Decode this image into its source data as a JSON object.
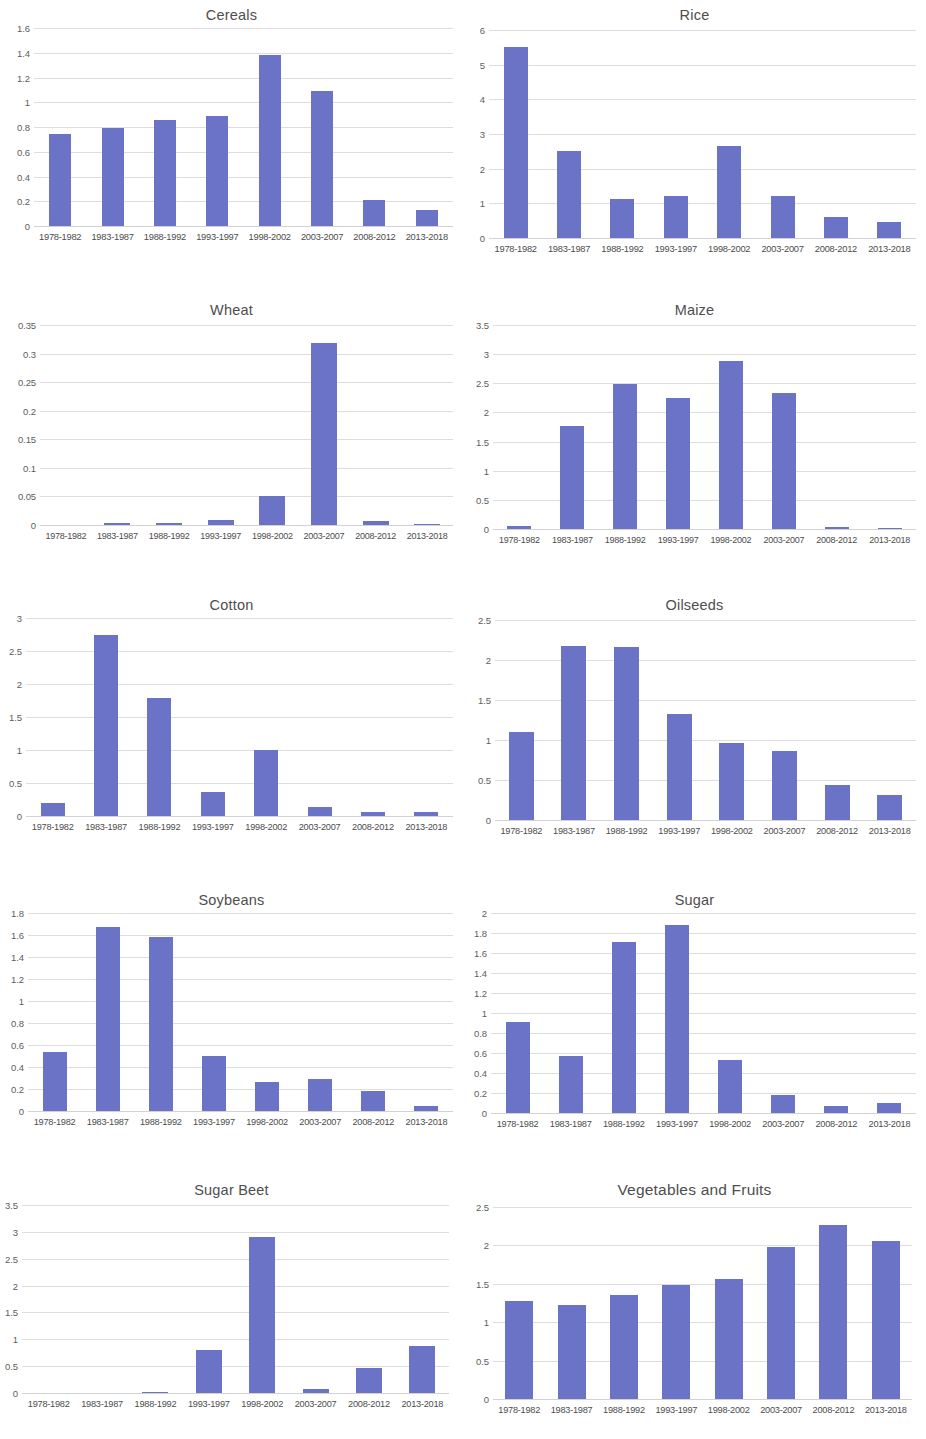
{
  "figure": {
    "panel_count": 8,
    "bar_color": "#6b73c6",
    "gridline_color": "#d8d8dc",
    "categories": [
      "1978-1982",
      "1983-1987",
      "1988-1992",
      "1993-1997",
      "1998-2002",
      "2003-2007",
      "2008-2012",
      "2013-2018"
    ]
  },
  "chart_data": [
    {
      "type": "bar",
      "title": "Cereals",
      "xlabel": "",
      "ylabel": "",
      "categories": [
        "1978-1982",
        "1983-1987",
        "1988-1992",
        "1993-1997",
        "1998-2002",
        "2003-2007",
        "2008-2012",
        "2013-2018"
      ],
      "values": [
        0.74,
        0.79,
        0.86,
        0.89,
        1.38,
        1.09,
        0.21,
        0.13
      ],
      "ylim": [
        0,
        1.6
      ],
      "yticks": [
        0,
        0.2,
        0.4,
        0.6,
        0.8,
        1,
        1.2,
        1.4,
        1.6
      ],
      "ytick_labels": [
        "0",
        "0.2",
        "0.4",
        "0.6",
        "0.8",
        "1",
        "1.2",
        "1.4",
        "1.6"
      ],
      "grid": true,
      "legend": "none"
    },
    {
      "type": "bar",
      "title": "Rice",
      "xlabel": "",
      "ylabel": "",
      "categories": [
        "1978-1982",
        "1983-1987",
        "1988-1992",
        "1993-1997",
        "1998-2002",
        "2003-2007",
        "2008-2012",
        "2013-2018"
      ],
      "values": [
        5.5,
        2.5,
        1.12,
        1.2,
        2.65,
        1.22,
        0.62,
        0.45
      ],
      "ylim": [
        0,
        6
      ],
      "yticks": [
        0,
        1,
        2,
        3,
        4,
        5,
        6
      ],
      "ytick_labels": [
        "0",
        "1",
        "2",
        "3",
        "4",
        "5",
        "6"
      ],
      "grid": true,
      "legend": "none"
    },
    {
      "type": "bar",
      "title": "Wheat",
      "xlabel": "",
      "ylabel": "",
      "categories": [
        "1978-1982",
        "1983-1987",
        "1988-1992",
        "1993-1997",
        "1998-2002",
        "2003-2007",
        "2008-2012",
        "2013-2018"
      ],
      "values": [
        0,
        0.003,
        0.003,
        0.009,
        0.051,
        0.318,
        0.007,
        0.002
      ],
      "ylim": [
        0,
        0.35
      ],
      "yticks": [
        0,
        0.05,
        0.1,
        0.15,
        0.2,
        0.25,
        0.3,
        0.35
      ],
      "ytick_labels": [
        "0",
        "0.05",
        "0.1",
        "0.15",
        "0.2",
        "0.25",
        "0.3",
        "0.35"
      ],
      "grid": true,
      "legend": "none"
    },
    {
      "type": "bar",
      "title": "Maize",
      "xlabel": "",
      "ylabel": "",
      "categories": [
        "1978-1982",
        "1983-1987",
        "1988-1992",
        "1993-1997",
        "1998-2002",
        "2003-2007",
        "2008-2012",
        "2013-2018"
      ],
      "values": [
        0.06,
        1.76,
        2.48,
        2.25,
        2.89,
        2.34,
        0.04,
        0.005
      ],
      "ylim": [
        0,
        3.5
      ],
      "yticks": [
        0,
        0.5,
        1,
        1.5,
        2,
        2.5,
        3,
        3.5
      ],
      "ytick_labels": [
        "0",
        "0.5",
        "1",
        "1.5",
        "2",
        "2.5",
        "3",
        "3.5"
      ],
      "grid": true,
      "legend": "none"
    },
    {
      "type": "bar",
      "title": "Cotton",
      "xlabel": "",
      "ylabel": "",
      "categories": [
        "1978-1982",
        "1983-1987",
        "1988-1992",
        "1993-1997",
        "1998-2002",
        "2003-2007",
        "2008-2012",
        "2013-2018"
      ],
      "values": [
        0.19,
        2.74,
        1.79,
        0.37,
        1.0,
        0.13,
        0.06,
        0.06
      ],
      "ylim": [
        0,
        3
      ],
      "yticks": [
        0,
        0.5,
        1,
        1.5,
        2,
        2.5,
        3
      ],
      "ytick_labels": [
        "0",
        "0.5",
        "1",
        "1.5",
        "2",
        "2.5",
        "3"
      ],
      "grid": true,
      "legend": "none"
    },
    {
      "type": "bar",
      "title": "Oilseeds",
      "xlabel": "",
      "ylabel": "",
      "categories": [
        "1978-1982",
        "1983-1987",
        "1988-1992",
        "1993-1997",
        "1998-2002",
        "2003-2007",
        "2008-2012",
        "2013-2018"
      ],
      "values": [
        1.1,
        2.18,
        2.16,
        1.33,
        0.96,
        0.86,
        0.44,
        0.31
      ],
      "ylim": [
        0,
        2.5
      ],
      "yticks": [
        0,
        0.5,
        1,
        1.5,
        2,
        2.5
      ],
      "ytick_labels": [
        "0",
        "0.5",
        "1",
        "1.5",
        "2",
        "2.5"
      ],
      "grid": true,
      "legend": "none"
    },
    {
      "type": "bar",
      "title": "Soybeans",
      "xlabel": "",
      "ylabel": "",
      "categories": [
        "1978-1982",
        "1983-1987",
        "1988-1992",
        "1993-1997",
        "1998-2002",
        "2003-2007",
        "2008-2012",
        "2013-2018"
      ],
      "values": [
        0.54,
        1.67,
        1.58,
        0.5,
        0.26,
        0.29,
        0.18,
        0.05
      ],
      "ylim": [
        0,
        1.8
      ],
      "yticks": [
        0,
        0.2,
        0.4,
        0.6,
        0.8,
        1,
        1.2,
        1.4,
        1.6,
        1.8
      ],
      "ytick_labels": [
        "0",
        "0.2",
        "0.4",
        "0.6",
        "0.8",
        "1",
        "1.2",
        "1.4",
        "1.6",
        "1.8"
      ],
      "grid": true,
      "legend": "none"
    },
    {
      "type": "bar",
      "title": "Sugar",
      "xlabel": "",
      "ylabel": "",
      "categories": [
        "1978-1982",
        "1983-1987",
        "1988-1992",
        "1993-1997",
        "1998-2002",
        "2003-2007",
        "2008-2012",
        "2013-2018"
      ],
      "values": [
        0.91,
        0.57,
        1.71,
        1.88,
        0.53,
        0.18,
        0.07,
        0.1
      ],
      "ylim": [
        0,
        2
      ],
      "yticks": [
        0,
        0.2,
        0.4,
        0.6,
        0.8,
        1,
        1.2,
        1.4,
        1.6,
        1.8,
        2
      ],
      "ytick_labels": [
        "0",
        "0.2",
        "0.4",
        "0.6",
        "0.8",
        "1",
        "1.2",
        "1.4",
        "1.6",
        "1.8",
        "2"
      ],
      "grid": true,
      "legend": "none"
    },
    {
      "type": "bar",
      "title": "Sugar Beet",
      "xlabel": "",
      "ylabel": "",
      "categories": [
        "1978-1982",
        "1983-1987",
        "1988-1992",
        "1993-1997",
        "1998-2002",
        "2003-2007",
        "2008-2012",
        "2013-2018"
      ],
      "values": [
        0,
        0,
        0.02,
        0.81,
        2.9,
        0.07,
        0.47,
        0.88
      ],
      "ylim": [
        0,
        3.5
      ],
      "yticks": [
        0,
        0.5,
        1,
        1.5,
        2,
        2.5,
        3,
        3.5
      ],
      "ytick_labels": [
        "0",
        "0.5",
        "1",
        "1.5",
        "2",
        "2.5",
        "3",
        "3.5"
      ],
      "grid": true,
      "legend": "none"
    },
    {
      "type": "bar",
      "title": "Vegetables and Fruits",
      "xlabel": "",
      "ylabel": "",
      "categories": [
        "1978-1982",
        "1983-1987",
        "1988-1992",
        "1993-1997",
        "1998-2002",
        "2003-2007",
        "2008-2012",
        "2013-2018"
      ],
      "values": [
        1.28,
        1.22,
        1.36,
        1.48,
        1.56,
        1.98,
        2.26,
        2.06
      ],
      "ylim": [
        0,
        2.5
      ],
      "yticks": [
        0,
        0.5,
        1,
        1.5,
        2,
        2.5
      ],
      "ytick_labels": [
        "0",
        "0.5",
        "1",
        "1.5",
        "2",
        "2.5"
      ],
      "grid": true,
      "legend": "none"
    }
  ]
}
